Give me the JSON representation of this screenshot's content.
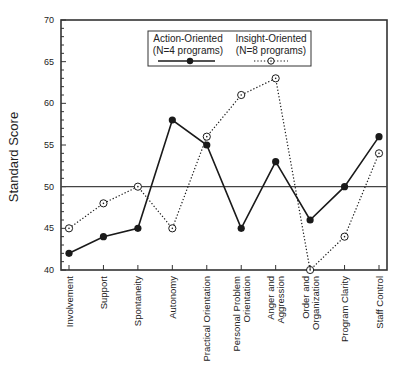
{
  "chart_data": {
    "type": "line",
    "title": "",
    "xlabel": "",
    "ylabel": "Standard Score",
    "ylim": [
      40,
      70
    ],
    "yticks": [
      40,
      45,
      50,
      55,
      60,
      65,
      70
    ],
    "reference_line": 50,
    "grid": false,
    "legend_position": "top-center (inside plot)",
    "categories": [
      "Involvement",
      "Support",
      "Spontaneity",
      "Autonomy",
      "Practical Orientation",
      "Personal Problem Orientation",
      "Anger and Aggression",
      "Order and Organization",
      "Program Clarity",
      "Staff Control"
    ],
    "category_label_lines": [
      [
        "Involvement"
      ],
      [
        "Support"
      ],
      [
        "Spontaneity"
      ],
      [
        "Autonomy"
      ],
      [
        "Practical Orientation"
      ],
      [
        "Personal Problem",
        "Orientation"
      ],
      [
        "Anger and",
        "Aggression"
      ],
      [
        "Order and",
        "Organization"
      ],
      [
        "Program Clarity"
      ],
      [
        "Staff Control"
      ]
    ],
    "series": [
      {
        "name": "Action-Oriented",
        "sub": "(N=4 programs)",
        "style": "solid",
        "marker": "filled-circle",
        "color": "#1a1a1a",
        "values": [
          42,
          44,
          45,
          58,
          55,
          45,
          53,
          46,
          50,
          56
        ]
      },
      {
        "name": "Insight-Oriented",
        "sub": "(N=8 programs)",
        "style": "dotted",
        "marker": "open-circle-dot",
        "color": "#1a1a1a",
        "values": [
          45,
          48,
          50,
          45,
          56,
          61,
          63,
          40,
          44,
          54
        ]
      }
    ]
  }
}
